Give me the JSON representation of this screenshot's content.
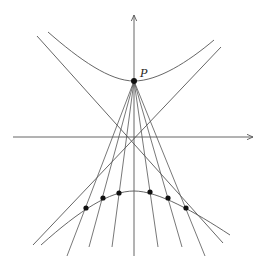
{
  "diagram": {
    "title": "",
    "labels": {
      "point_p": "P"
    },
    "colors": {
      "stroke": "#555555",
      "point": "#111111",
      "background": "#ffffff"
    },
    "axes": {
      "x_axis": {
        "from": [
          13,
          137
        ],
        "to": [
          253,
          137
        ],
        "arrow": true
      },
      "y_axis": {
        "from": [
          134,
          256
        ],
        "to": [
          134,
          14
        ],
        "arrow": true
      }
    },
    "asymptotes": [
      {
        "from": [
          37,
          36
        ],
        "to": [
          223,
          243
        ]
      },
      {
        "from": [
          221,
          47
        ],
        "to": [
          33,
          245
        ]
      }
    ],
    "upper_branch_vertex": [
      134,
      81
    ],
    "lower_branch_vertex": [
      134,
      191
    ],
    "point_p": [
      134,
      81
    ],
    "lower_points": [
      [
        86,
        208
      ],
      [
        103,
        198
      ],
      [
        119,
        193
      ],
      [
        150,
        192
      ],
      [
        168,
        198
      ],
      [
        186,
        208
      ]
    ],
    "ray_endpoints": [
      [
        67,
        256
      ],
      [
        89,
        247
      ],
      [
        112,
        247
      ],
      [
        135,
        256
      ],
      [
        158,
        247
      ],
      [
        182,
        247
      ]
    ]
  }
}
